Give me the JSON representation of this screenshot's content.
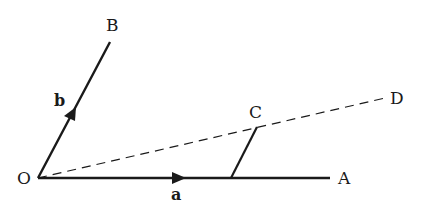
{
  "diagram": {
    "points": {
      "O": {
        "label": "O",
        "x": 38,
        "y": 178
      },
      "A": {
        "label": "A",
        "x": 330,
        "y": 178
      },
      "B": {
        "label": "B",
        "x": 110,
        "y": 42
      },
      "C": {
        "label": "C",
        "x": 257,
        "y": 127
      },
      "D": {
        "label": "D",
        "x": 385,
        "y": 98
      },
      "F": {
        "x": 231,
        "y": 178
      }
    },
    "labels": {
      "O": "O",
      "A": "A",
      "B": "B",
      "C": "C",
      "D": "D",
      "vector_a": "a",
      "vector_b": "b"
    },
    "segments": [
      {
        "from": "O",
        "to": "A",
        "style": "solid",
        "arrow": "mid",
        "vector_label": "a"
      },
      {
        "from": "O",
        "to": "B",
        "style": "solid",
        "arrow": "mid",
        "vector_label": "b"
      },
      {
        "from": "O",
        "to": "D",
        "style": "dashed"
      },
      {
        "from": "F",
        "to": "C",
        "style": "solid"
      }
    ],
    "colors": {
      "stroke": "#1a1a1a",
      "background": "#ffffff"
    }
  }
}
